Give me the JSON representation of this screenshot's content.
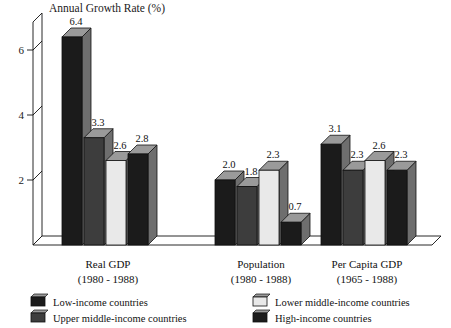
{
  "chart_data": {
    "type": "bar",
    "title": "Annual Growth Rate  (%)",
    "ylabel": "Annual Growth Rate (%)",
    "xlabel": "",
    "ylim": [
      0,
      7.2
    ],
    "yticks": [
      2,
      4,
      6
    ],
    "ytick_labels": [
      "2",
      "4",
      "6"
    ],
    "grid": false,
    "legend_position": "bottom",
    "style": "3d-bar",
    "categories": [
      "Real GDP",
      "Population",
      "Per Capita GDP"
    ],
    "category_sublabels": [
      "(1980 - 1988)",
      "(1980 - 1988)",
      "(1965 - 1988)"
    ],
    "series": [
      {
        "name": "Low-income countries",
        "color": "#1b1b1b",
        "values": [
          6.4,
          2.0,
          3.1
        ]
      },
      {
        "name": "Upper middle-income countries",
        "color": "#3d3d3d",
        "values": [
          3.3,
          1.8,
          2.3
        ]
      },
      {
        "name": "Lower middle-income countries",
        "color": "#e9e9e9",
        "values": [
          2.6,
          2.3,
          2.6
        ]
      },
      {
        "name": "High-income countries",
        "color": "#1b1b1b",
        "values": [
          2.8,
          0.7,
          2.3
        ]
      }
    ],
    "value_labels": [
      [
        "6.4",
        "3.3",
        "2.6",
        "2.8"
      ],
      [
        "2.0",
        "1.8",
        "2.3",
        "0.7"
      ],
      [
        "3.1",
        "2.3",
        "2.6",
        "2.3"
      ]
    ]
  },
  "legend": {
    "entries": [
      {
        "label": "Low-income countries",
        "swatch": "#1b1b1b"
      },
      {
        "label": "Lower middle-income countries",
        "swatch": "#e9e9e9"
      },
      {
        "label": "Upper middle-income countries",
        "swatch": "#3d3d3d"
      },
      {
        "label": "High-income countries",
        "swatch": "#1b1b1b"
      }
    ]
  },
  "colors": {
    "low_income": "#1b1b1b",
    "upper_middle": "#3d3d3d",
    "lower_middle": "#e9e9e9",
    "high_income": "#1b1b1b",
    "bevel_top": "#9a9a9a",
    "bevel_side": "#6e6e6e",
    "outline": "#111111",
    "background": "#ffffff"
  }
}
